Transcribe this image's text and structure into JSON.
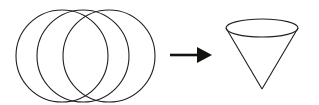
{
  "figure": {
    "background_color": "#ffffff",
    "stroke_color": "#211f1e",
    "arrow_color": "#141312",
    "width": 319,
    "height": 105
  },
  "left_group": {
    "name": "three overlapping circles",
    "count": 3,
    "circles": [
      {
        "label": "back circle",
        "cx": 62,
        "cy": 56,
        "r": 46
      },
      {
        "label": "middle circle",
        "cx": 83,
        "cy": 56,
        "r": 46
      },
      {
        "label": "front circle",
        "cx": 109,
        "cy": 56,
        "r": 46
      }
    ]
  },
  "arrow": {
    "name": "rightward transformation arrow",
    "direction": "right",
    "shaft": {
      "x1": 170,
      "y1": 55,
      "x2": 199,
      "y2": 55
    },
    "head": {
      "points": "197,47 212,55 197,63"
    }
  },
  "right_group": {
    "name": "cone pointing downward",
    "ellipse": {
      "cx": 262,
      "cy": 28,
      "rx": 36,
      "ry": 9
    },
    "apex": {
      "x": 262,
      "y": 89
    },
    "left_side": {
      "x1": 226,
      "y1": 28,
      "x2": 262,
      "y2": 89
    },
    "right_side": {
      "x1": 298,
      "y1": 28,
      "x2": 262,
      "y2": 89
    }
  }
}
